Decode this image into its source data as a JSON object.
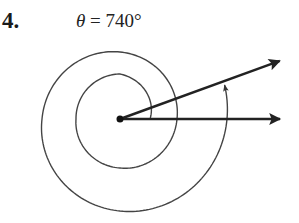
{
  "problem": {
    "number": "4.",
    "label_symbol": "θ",
    "label_rest": " = 740°"
  },
  "diagram": {
    "angle_degrees": 740,
    "center": [
      120,
      119
    ],
    "initial_side_end": [
      280,
      119
    ],
    "terminal_side_angle_deg": 20,
    "terminal_side_length": 170,
    "spiral_radii_at_quarter_turns": [
      30,
      45,
      44,
      49,
      57,
      67,
      78,
      92,
      107
    ],
    "line_color": "#222222",
    "arc_color": "#444444"
  }
}
